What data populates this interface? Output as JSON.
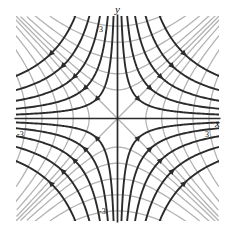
{
  "figure": {
    "kind": "phase-portrait",
    "background": "#ffffff"
  },
  "axes": {
    "x_label": "x",
    "y_label": "y",
    "xlim": [
      -3.4,
      3.4
    ],
    "ylim": [
      -3.4,
      3.4
    ],
    "axis_color": "#2b2b2b",
    "ticks": {
      "x": [
        {
          "value": -3,
          "label": "-3"
        },
        {
          "value": 3,
          "label": "3"
        }
      ],
      "y": [
        {
          "value": 3,
          "label": "3"
        },
        {
          "value": -3,
          "label": "-3"
        }
      ]
    },
    "axis_arrows": {
      "x_axis": [
        {
          "at": [
            -1.05,
            0
          ],
          "direction": "left"
        },
        {
          "at": [
            1.05,
            0
          ],
          "direction": "right"
        }
      ],
      "y_axis": [
        {
          "at": [
            0,
            1.05
          ],
          "direction": "down"
        },
        {
          "at": [
            0,
            -1.05
          ],
          "direction": "up"
        }
      ]
    }
  },
  "chart_data": {
    "type": "line",
    "title": "",
    "xlabel": "x",
    "ylabel": "y",
    "xlim": [
      -3.4,
      3.4
    ],
    "ylim": [
      -3.4,
      3.4
    ],
    "grid": false,
    "legend": "none",
    "series": [
      {
        "name": "field-lines",
        "equation": "x*y = c",
        "color": "#2b2b2b",
        "width": 1.9,
        "arrows": true,
        "levels": [
          0.45,
          1.1,
          2.0,
          3.2,
          4.8,
          -0.45,
          -1.1,
          -2.0,
          -3.2,
          -4.8
        ]
      },
      {
        "name": "orthogonal-curves",
        "equation": "x^2 - y^2 = c",
        "color": "#b3b3b3",
        "width": 1.3,
        "arrows": false,
        "levels": [
          0,
          0.9,
          2.2,
          4.0,
          6.4,
          9.4,
          -0.9,
          -2.2,
          -4.0,
          -6.4,
          -9.4
        ]
      }
    ],
    "separatrices": {
      "name": "asymptotes",
      "equations": [
        "y = x",
        "y = -x"
      ],
      "color": "#b3b3b3"
    }
  },
  "colors": {
    "dark_curve": "#2b2b2b",
    "gray_curve": "#b3b3b3",
    "axis": "#2b2b2b",
    "text": "#111111"
  }
}
